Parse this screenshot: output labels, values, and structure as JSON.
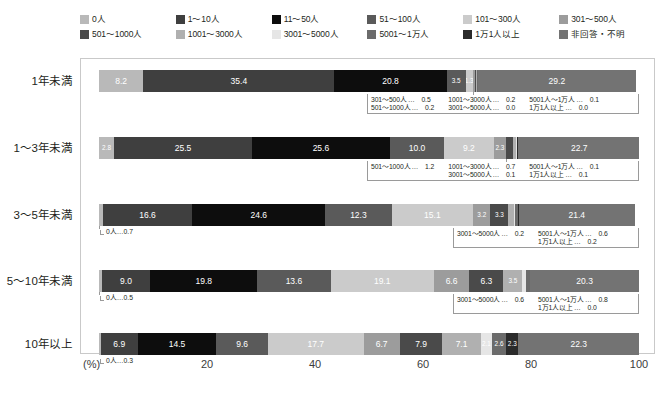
{
  "chart_data": {
    "type": "bar",
    "orientation": "horizontal",
    "stacked": true,
    "title": "",
    "xlabel": "(%)",
    "ylabel": "",
    "xlim": [
      0,
      100
    ],
    "xticks": [
      "(%)",
      "20",
      "40",
      "60",
      "80",
      "100"
    ],
    "grid": false,
    "legend_position": "top",
    "categories": [
      "1年未満",
      "1〜3年未満",
      "3〜5年未満",
      "5〜10年未満",
      "10年以上"
    ],
    "series": [
      {
        "name": "0人",
        "color": "#b9b9b9",
        "values": [
          8.2,
          2.8,
          0.7,
          0.5,
          0.3
        ]
      },
      {
        "name": "1〜10人",
        "color": "#3f3f3f",
        "values": [
          35.4,
          25.5,
          16.6,
          9.0,
          6.9
        ]
      },
      {
        "name": "11〜50人",
        "color": "#0d0d0d",
        "values": [
          20.8,
          25.6,
          24.6,
          19.8,
          14.5
        ]
      },
      {
        "name": "51〜100人",
        "color": "#5a5a5a",
        "values": [
          3.5,
          10.0,
          12.3,
          13.6,
          9.6
        ]
      },
      {
        "name": "101〜300人",
        "color": "#cbcbcb",
        "values": [
          1.3,
          9.2,
          15.1,
          19.1,
          17.7
        ]
      },
      {
        "name": "301〜500人",
        "color": "#9c9c9c",
        "values": [
          0.5,
          2.3,
          3.2,
          6.6,
          6.7
        ]
      },
      {
        "name": "501〜1000人",
        "color": "#4a4a4a",
        "values": [
          0.2,
          1.2,
          3.3,
          6.3,
          7.9
        ]
      },
      {
        "name": "1001〜3000人",
        "color": "#b0b0b0",
        "values": [
          0.2,
          0.7,
          1.0,
          3.5,
          7.1
        ]
      },
      {
        "name": "3001〜5000人",
        "color": "#e6e6e6",
        "values": [
          0.0,
          0.1,
          0.2,
          0.6,
          2.1
        ]
      },
      {
        "name": "5001〜1万人",
        "color": "#6b6b6b",
        "values": [
          0.1,
          0.1,
          0.6,
          0.8,
          2.6
        ]
      },
      {
        "name": "1万1人以上",
        "color": "#2b2b2b",
        "values": [
          0.0,
          0.1,
          0.2,
          0.0,
          2.3
        ]
      },
      {
        "name": "非回答・不明",
        "color": "#737373",
        "values": [
          29.2,
          22.7,
          21.4,
          20.3,
          22.3
        ]
      }
    ]
  },
  "legend": {
    "rows": [
      [
        {
          "label": "0人",
          "color": "#b9b9b9"
        },
        {
          "label": "1〜10人",
          "color": "#3f3f3f"
        },
        {
          "label": "11〜50人",
          "color": "#0d0d0d"
        },
        {
          "label": "51〜100人",
          "color": "#5a5a5a"
        },
        {
          "label": "101〜300人",
          "color": "#cbcbcb"
        },
        {
          "label": "301〜500人",
          "color": "#9c9c9c"
        }
      ],
      [
        {
          "label": "501〜1000人",
          "color": "#4a4a4a"
        },
        {
          "label": "1001〜3000人",
          "color": "#b0b0b0"
        },
        {
          "label": "3001〜5000人",
          "color": "#e6e6e6"
        },
        {
          "label": "5001〜1万人",
          "color": "#6b6b6b"
        },
        {
          "label": "1万1人以上",
          "color": "#2b2b2b"
        },
        {
          "label": "非回答・不明",
          "color": "#737373"
        }
      ]
    ]
  },
  "rows": [
    {
      "label": "1年未満",
      "segments": [
        {
          "name": "0人",
          "value": "8.2",
          "pct": 8.2,
          "color": "#b9b9b9",
          "text": "#ffffff",
          "show": true
        },
        {
          "name": "1〜10人",
          "value": "35.4",
          "pct": 35.4,
          "color": "#3f3f3f",
          "text": "#ffffff",
          "show": true
        },
        {
          "name": "11〜50人",
          "value": "20.8",
          "pct": 20.8,
          "color": "#0d0d0d",
          "text": "#ffffff",
          "show": true
        },
        {
          "name": "51〜100人",
          "value": "3.5",
          "pct": 3.5,
          "color": "#5a5a5a",
          "text": "#ffffff",
          "show": true
        },
        {
          "name": "101〜300人",
          "value": "1.3",
          "pct": 1.3,
          "color": "#cbcbcb",
          "text": "#ffffff",
          "show": true
        },
        {
          "name": "301〜500人",
          "value": "0.5",
          "pct": 0.5,
          "color": "#9c9c9c",
          "text": "#ffffff",
          "show": false
        },
        {
          "name": "501〜1000人",
          "value": "0.2",
          "pct": 0.2,
          "color": "#4a4a4a",
          "text": "#ffffff",
          "show": false
        },
        {
          "name": "1001〜3000人",
          "value": "0.2",
          "pct": 0.2,
          "color": "#b0b0b0",
          "text": "#ffffff",
          "show": false
        },
        {
          "name": "3001〜5000人",
          "value": "0.0",
          "pct": 0.0,
          "color": "#e6e6e6",
          "text": "#ffffff",
          "show": false
        },
        {
          "name": "5001〜1万人",
          "value": "0.1",
          "pct": 0.1,
          "color": "#6b6b6b",
          "text": "#ffffff",
          "show": false
        },
        {
          "name": "1万1人以上",
          "value": "0.0",
          "pct": 0.0,
          "color": "#2b2b2b",
          "text": "#ffffff",
          "show": false
        },
        {
          "name": "非回答・不明",
          "value": "29.2",
          "pct": 29.2,
          "color": "#737373",
          "text": "#ffffff",
          "show": true
        }
      ],
      "left_note": null,
      "callout": {
        "columns": [
          [
            {
              "name": "301〜500人",
              "dots": "…",
              "value": "0.5"
            },
            {
              "name": "501〜1000人",
              "dots": "…",
              "value": "0.2"
            }
          ],
          [
            {
              "name": "1001〜3000人",
              "dots": "…",
              "value": "0.2"
            },
            {
              "name": "3001〜5000人",
              "dots": "…",
              "value": "0.0"
            }
          ],
          [
            {
              "name": "5001人〜1万人",
              "dots": "…",
              "value": "0.1"
            },
            {
              "name": "1万1人以上",
              "dots": "…",
              "value": "0.0"
            }
          ]
        ]
      }
    },
    {
      "label": "1〜3年未満",
      "segments": [
        {
          "name": "0人",
          "value": "2.8",
          "pct": 2.8,
          "color": "#b9b9b9",
          "text": "#ffffff",
          "show": true
        },
        {
          "name": "1〜10人",
          "value": "25.5",
          "pct": 25.5,
          "color": "#3f3f3f",
          "text": "#ffffff",
          "show": true
        },
        {
          "name": "11〜50人",
          "value": "25.6",
          "pct": 25.6,
          "color": "#0d0d0d",
          "text": "#ffffff",
          "show": true
        },
        {
          "name": "51〜100人",
          "value": "10.0",
          "pct": 10.0,
          "color": "#5a5a5a",
          "text": "#ffffff",
          "show": true
        },
        {
          "name": "101〜300人",
          "value": "9.2",
          "pct": 9.2,
          "color": "#cbcbcb",
          "text": "#ffffff",
          "show": true
        },
        {
          "name": "301〜500人",
          "value": "2.3",
          "pct": 2.3,
          "color": "#9c9c9c",
          "text": "#ffffff",
          "show": true
        },
        {
          "name": "501〜1000人",
          "value": "1.2",
          "pct": 1.2,
          "color": "#4a4a4a",
          "text": "#ffffff",
          "show": false
        },
        {
          "name": "1001〜3000人",
          "value": "0.7",
          "pct": 0.7,
          "color": "#b0b0b0",
          "text": "#ffffff",
          "show": false
        },
        {
          "name": "3001〜5000人",
          "value": "0.1",
          "pct": 0.1,
          "color": "#e6e6e6",
          "text": "#ffffff",
          "show": false
        },
        {
          "name": "5001〜1万人",
          "value": "0.1",
          "pct": 0.1,
          "color": "#6b6b6b",
          "text": "#ffffff",
          "show": false
        },
        {
          "name": "1万1人以上",
          "value": "0.1",
          "pct": 0.1,
          "color": "#2b2b2b",
          "text": "#ffffff",
          "show": false
        },
        {
          "name": "非回答・不明",
          "value": "22.7",
          "pct": 22.7,
          "color": "#737373",
          "text": "#ffffff",
          "show": true
        }
      ],
      "left_note": null,
      "callout": {
        "columns": [
          [
            {
              "name": "501〜1000人",
              "dots": "…",
              "value": "1.2"
            }
          ],
          [
            {
              "name": "1001〜3000人",
              "dots": "…",
              "value": "0.7"
            },
            {
              "name": "3001〜5000人",
              "dots": "…",
              "value": "0.1"
            }
          ],
          [
            {
              "name": "5001人〜1万人",
              "dots": "…",
              "value": "0.1"
            },
            {
              "name": "1万1人以上",
              "dots": "…",
              "value": "0.1"
            }
          ]
        ]
      }
    },
    {
      "label": "3〜5年未満",
      "segments": [
        {
          "name": "0人",
          "value": "0.7",
          "pct": 0.7,
          "color": "#b9b9b9",
          "text": "#ffffff",
          "show": false
        },
        {
          "name": "1〜10人",
          "value": "16.6",
          "pct": 16.6,
          "color": "#3f3f3f",
          "text": "#ffffff",
          "show": true
        },
        {
          "name": "11〜50人",
          "value": "24.6",
          "pct": 24.6,
          "color": "#0d0d0d",
          "text": "#ffffff",
          "show": true
        },
        {
          "name": "51〜100人",
          "value": "12.3",
          "pct": 12.3,
          "color": "#5a5a5a",
          "text": "#ffffff",
          "show": true
        },
        {
          "name": "101〜300人",
          "value": "15.1",
          "pct": 15.1,
          "color": "#cbcbcb",
          "text": "#ffffff",
          "show": true
        },
        {
          "name": "301〜500人",
          "value": "3.2",
          "pct": 3.2,
          "color": "#9c9c9c",
          "text": "#ffffff",
          "show": true
        },
        {
          "name": "501〜1000人",
          "value": "3.3",
          "pct": 3.3,
          "color": "#4a4a4a",
          "text": "#ffffff",
          "show": true
        },
        {
          "name": "1001〜3000人",
          "value": "1.0",
          "pct": 1.0,
          "color": "#b0b0b0",
          "text": "#ffffff",
          "show": false
        },
        {
          "name": "3001〜5000人",
          "value": "0.2",
          "pct": 0.2,
          "color": "#e6e6e6",
          "text": "#ffffff",
          "show": false
        },
        {
          "name": "5001〜1万人",
          "value": "0.6",
          "pct": 0.6,
          "color": "#6b6b6b",
          "text": "#ffffff",
          "show": false
        },
        {
          "name": "1万1人以上",
          "value": "0.2",
          "pct": 0.2,
          "color": "#2b2b2b",
          "text": "#ffffff",
          "show": false
        },
        {
          "name": "非回答・不明",
          "value": "21.4",
          "pct": 21.4,
          "color": "#737373",
          "text": "#ffffff",
          "show": true
        }
      ],
      "left_note": {
        "name": "0人",
        "dots": "…",
        "value": "0.7"
      },
      "callout": {
        "columns": [
          [
            {
              "name": "3001〜5000人",
              "dots": "…",
              "value": "0.2"
            }
          ],
          [
            {
              "name": "5001人〜1万人",
              "dots": "…",
              "value": "0.6"
            },
            {
              "name": "1万1人以上",
              "dots": "…",
              "value": "0.2"
            }
          ]
        ]
      }
    },
    {
      "label": "5〜10年未満",
      "segments": [
        {
          "name": "0人",
          "value": "0.5",
          "pct": 0.5,
          "color": "#b9b9b9",
          "text": "#ffffff",
          "show": false
        },
        {
          "name": "1〜10人",
          "value": "9.0",
          "pct": 9.0,
          "color": "#3f3f3f",
          "text": "#ffffff",
          "show": true
        },
        {
          "name": "11〜50人",
          "value": "19.8",
          "pct": 19.8,
          "color": "#0d0d0d",
          "text": "#ffffff",
          "show": true
        },
        {
          "name": "51〜100人",
          "value": "13.6",
          "pct": 13.6,
          "color": "#5a5a5a",
          "text": "#ffffff",
          "show": true
        },
        {
          "name": "101〜300人",
          "value": "19.1",
          "pct": 19.1,
          "color": "#cbcbcb",
          "text": "#ffffff",
          "show": true
        },
        {
          "name": "301〜500人",
          "value": "6.6",
          "pct": 6.6,
          "color": "#9c9c9c",
          "text": "#ffffff",
          "show": true
        },
        {
          "name": "501〜1000人",
          "value": "6.3",
          "pct": 6.3,
          "color": "#4a4a4a",
          "text": "#ffffff",
          "show": true
        },
        {
          "name": "1001〜3000人",
          "value": "3.5",
          "pct": 3.5,
          "color": "#b0b0b0",
          "text": "#ffffff",
          "show": true
        },
        {
          "name": "3001〜5000人",
          "value": "0.6",
          "pct": 0.6,
          "color": "#e6e6e6",
          "text": "#ffffff",
          "show": false
        },
        {
          "name": "5001〜1万人",
          "value": "0.8",
          "pct": 0.8,
          "color": "#6b6b6b",
          "text": "#ffffff",
          "show": false
        },
        {
          "name": "1万1人以上",
          "value": "0.0",
          "pct": 0.0,
          "color": "#2b2b2b",
          "text": "#ffffff",
          "show": false
        },
        {
          "name": "非回答・不明",
          "value": "20.3",
          "pct": 20.3,
          "color": "#737373",
          "text": "#ffffff",
          "show": true
        }
      ],
      "left_note": {
        "name": "0人",
        "dots": "…",
        "value": "0.5"
      },
      "callout": {
        "columns": [
          [
            {
              "name": "3001〜5000人",
              "dots": "…",
              "value": "0.6"
            }
          ],
          [
            {
              "name": "5001人〜1万人",
              "dots": "…",
              "value": "0.8"
            },
            {
              "name": "1万1人以上",
              "dots": "…",
              "value": "0.0"
            }
          ]
        ]
      }
    },
    {
      "label": "10年以上",
      "segments": [
        {
          "name": "0人",
          "value": "0.3",
          "pct": 0.3,
          "color": "#b9b9b9",
          "text": "#ffffff",
          "show": false
        },
        {
          "name": "1〜10人",
          "value": "6.9",
          "pct": 6.9,
          "color": "#3f3f3f",
          "text": "#ffffff",
          "show": true
        },
        {
          "name": "11〜50人",
          "value": "14.5",
          "pct": 14.5,
          "color": "#0d0d0d",
          "text": "#ffffff",
          "show": true
        },
        {
          "name": "51〜100人",
          "value": "9.6",
          "pct": 9.6,
          "color": "#5a5a5a",
          "text": "#ffffff",
          "show": true
        },
        {
          "name": "101〜300人",
          "value": "17.7",
          "pct": 17.7,
          "color": "#cbcbcb",
          "text": "#ffffff",
          "show": true
        },
        {
          "name": "301〜500人",
          "value": "6.7",
          "pct": 6.7,
          "color": "#9c9c9c",
          "text": "#ffffff",
          "show": true
        },
        {
          "name": "501〜1000人",
          "value": "7.9",
          "pct": 7.9,
          "color": "#4a4a4a",
          "text": "#ffffff",
          "show": true
        },
        {
          "name": "1001〜3000人",
          "value": "7.1",
          "pct": 7.1,
          "color": "#b0b0b0",
          "text": "#ffffff",
          "show": true
        },
        {
          "name": "3001〜5000人",
          "value": "2.1",
          "pct": 2.1,
          "color": "#e6e6e6",
          "text": "#ffffff",
          "show": true
        },
        {
          "name": "5001〜1万人",
          "value": "2.6",
          "pct": 2.6,
          "color": "#6b6b6b",
          "text": "#ffffff",
          "show": true
        },
        {
          "name": "1万1人以上",
          "value": "2.3",
          "pct": 2.3,
          "color": "#2b2b2b",
          "text": "#ffffff",
          "show": true
        },
        {
          "name": "非回答・不明",
          "value": "22.3",
          "pct": 22.3,
          "color": "#737373",
          "text": "#ffffff",
          "show": true
        }
      ],
      "left_note": {
        "name": "0人",
        "dots": "…",
        "value": "0.3"
      },
      "callout": null
    }
  ],
  "axis": {
    "ticks": [
      {
        "label": "(%)",
        "pos": 0
      },
      {
        "label": "20",
        "pos": 20
      },
      {
        "label": "40",
        "pos": 40
      },
      {
        "label": "60",
        "pos": 60
      },
      {
        "label": "80",
        "pos": 80
      },
      {
        "label": "100",
        "pos": 100
      }
    ]
  }
}
